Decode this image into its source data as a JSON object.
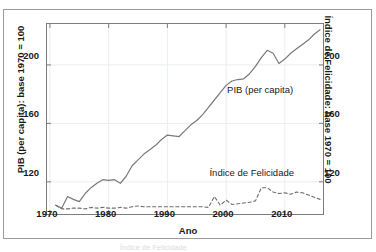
{
  "figure": {
    "caption_top_sliver": "",
    "caption_bottom_sliver": "Índice de Felicidade"
  },
  "colors": {
    "gdp_line": "#7a7a7a",
    "happiness_line": "#6e6e6e",
    "grid": "#e9eef2",
    "frame": "#7d7d7d",
    "outer_frame": "#9a9a9a",
    "text": "#1a1a1a"
  },
  "chart_data": {
    "type": "line",
    "title": "",
    "xlabel": "Ano",
    "ylabel": "PIB (per capita): base 1970 = 100",
    "ylabel_right": "Índice de Felicidade: base 1970 = 100",
    "xlim": [
      1969.5,
      2016.5
    ],
    "ylim": [
      98,
      228
    ],
    "xticks": [
      1970,
      1980,
      1990,
      2000,
      2010
    ],
    "yticks": [
      120,
      160,
      200
    ],
    "yticks_right": [
      120,
      160,
      200
    ],
    "grid": true,
    "legend_position": "in-plot annotations",
    "annotations": [
      {
        "text": "PIB (per capita)",
        "x": 2000,
        "y": 183
      },
      {
        "text": "Índice de Felicidade",
        "x": 1997,
        "y": 126
      }
    ],
    "series": [
      {
        "name": "PIB (per capita)",
        "style": "solid",
        "axis": "left",
        "x": [
          1971,
          1972,
          1973,
          1974,
          1975,
          1976,
          1977,
          1978,
          1979,
          1980,
          1981,
          1982,
          1983,
          1984,
          1985,
          1986,
          1987,
          1988,
          1989,
          1990,
          1991,
          1992,
          1993,
          1994,
          1995,
          1996,
          1997,
          1998,
          1999,
          2000,
          2001,
          2002,
          2003,
          2004,
          2005,
          2006,
          2007,
          2008,
          2009,
          2010,
          2011,
          2012,
          2013,
          2014,
          2015,
          2016
        ],
        "values": [
          104,
          102,
          110,
          108,
          106.5,
          112,
          116,
          119,
          121.5,
          121,
          121.5,
          119,
          124,
          131,
          135,
          139,
          142,
          145,
          149,
          152,
          151.5,
          151,
          155,
          159,
          162,
          166,
          171,
          176,
          181,
          186,
          189,
          190,
          190.5,
          194,
          199,
          205,
          210,
          208,
          201,
          204,
          208,
          211,
          214,
          217,
          221,
          224
        ]
      },
      {
        "name": "Índice de Felicidade",
        "style": "dashed",
        "axis": "right",
        "x": [
          1971,
          1972,
          1973,
          1974,
          1975,
          1976,
          1977,
          1978,
          1979,
          1980,
          1981,
          1982,
          1983,
          1984,
          1985,
          1986,
          1987,
          1988,
          1989,
          1990,
          1991,
          1992,
          1993,
          1994,
          1995,
          1996,
          1997,
          1998,
          1999,
          2000,
          2001,
          2002,
          2003,
          2004,
          2005,
          2006,
          2007,
          2008,
          2009,
          2010,
          2011,
          2012,
          2013,
          2014,
          2015,
          2016
        ],
        "values": [
          104,
          101.5,
          101.5,
          102,
          102,
          101.5,
          102.5,
          102,
          102.5,
          102,
          102,
          102.5,
          102,
          103,
          103.5,
          103,
          103,
          103,
          103,
          103,
          103,
          103,
          103,
          103,
          103,
          103,
          102.5,
          110,
          104,
          107.5,
          104.5,
          105,
          105.5,
          106,
          107,
          116,
          116,
          113,
          112,
          112.5,
          111.5,
          113,
          112.5,
          111,
          109.5,
          108
        ]
      }
    ]
  }
}
